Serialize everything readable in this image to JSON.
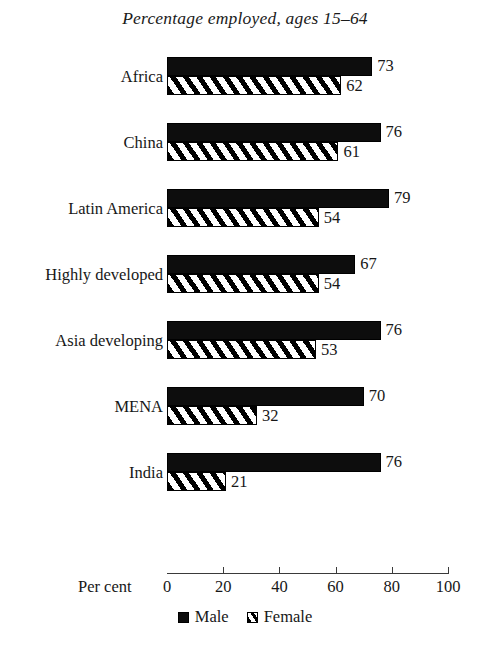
{
  "chart_data": {
    "type": "bar",
    "orientation": "horizontal",
    "title": "Percentage employed, ages 15–64",
    "xlabel": "Per cent",
    "ylabel": "",
    "xlim": [
      0,
      100
    ],
    "xticks": [
      0,
      20,
      40,
      60,
      80,
      100
    ],
    "xtick_labels": [
      "0",
      "20",
      "40",
      "60",
      "80",
      "100"
    ],
    "grid": false,
    "legend_position": "bottom-center",
    "categories": [
      "Africa",
      "China",
      "Latin America",
      "Highly developed",
      "Asia developing",
      "MENA",
      "India"
    ],
    "series": [
      {
        "name": "Male",
        "style": "solid-black",
        "values": [
          73,
          76,
          79,
          67,
          76,
          70,
          76
        ]
      },
      {
        "name": "Female",
        "style": "diagonal-hatch",
        "values": [
          62,
          61,
          54,
          54,
          53,
          32,
          21
        ]
      }
    ],
    "data_labels": [
      {
        "category": "Africa",
        "male": "73",
        "female": "62"
      },
      {
        "category": "China",
        "male": "76",
        "female": "61"
      },
      {
        "category": "Latin America",
        "male": "79",
        "female": "54"
      },
      {
        "category": "Highly developed",
        "male": "67",
        "female": "54"
      },
      {
        "category": "Asia developing",
        "male": "76",
        "female": "53"
      },
      {
        "category": "MENA",
        "male": "70",
        "female": "32"
      },
      {
        "category": "India",
        "male": "76",
        "female": "21"
      }
    ]
  },
  "legend": {
    "items": [
      {
        "label": "Male",
        "swatch": "filled-square-icon"
      },
      {
        "label": "Female",
        "swatch": "hatched-square-icon"
      }
    ]
  },
  "colors": {
    "male_fill": "#0d0d0d",
    "female_fill": "#ffffff",
    "female_hatch": "#000000",
    "axis": "#3a3a3a",
    "text": "#171717",
    "background": "#ffffff"
  }
}
